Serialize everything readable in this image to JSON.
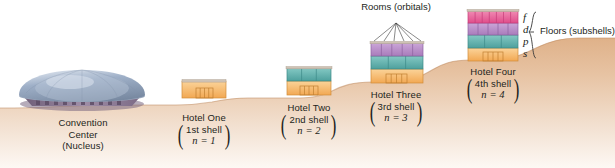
{
  "figure": {
    "background": "#ffffff"
  },
  "ground": {
    "name": "terraced-hillside",
    "colors": {
      "top": "#e8c8ab",
      "mid": "#d8ab86",
      "bottom": "#f6ece3",
      "edge": "#c08d63"
    }
  },
  "nucleus": {
    "label_lines": [
      "Convention",
      "Center",
      "(Nucleus)"
    ],
    "dome_color": "#8d9cb8",
    "dome_highlight": "#cdd6e4",
    "base_color": "#8a7590"
  },
  "hotels": [
    {
      "id": "hotel-one",
      "name_line": "Hotel One",
      "shell_line": "1st shell",
      "n_line": "n = 1",
      "floors": [
        {
          "subshell": "s",
          "rooms": 1,
          "color": "#f6b96a"
        }
      ]
    },
    {
      "id": "hotel-two",
      "name_line": "Hotel Two",
      "shell_line": "2nd shell",
      "n_line": "n = 2",
      "floors": [
        {
          "subshell": "p",
          "rooms": 3,
          "color": "#5fb3b0"
        },
        {
          "subshell": "s",
          "rooms": 1,
          "color": "#f6b96a"
        }
      ]
    },
    {
      "id": "hotel-three",
      "name_line": "Hotel Three",
      "shell_line": "3rd shell",
      "n_line": "n = 3",
      "floors": [
        {
          "subshell": "d",
          "rooms": 5,
          "color": "#b98fc9"
        },
        {
          "subshell": "p",
          "rooms": 3,
          "color": "#5fb3b0"
        },
        {
          "subshell": "s",
          "rooms": 1,
          "color": "#f6b96a"
        }
      ]
    },
    {
      "id": "hotel-four",
      "name_line": "Hotel Four",
      "shell_line": "4th shell",
      "n_line": "n = 4",
      "floors": [
        {
          "subshell": "f",
          "rooms": 7,
          "color": "#e8629a"
        },
        {
          "subshell": "d",
          "rooms": 5,
          "color": "#b98fc9"
        },
        {
          "subshell": "p",
          "rooms": 3,
          "color": "#5fb3b0"
        },
        {
          "subshell": "s",
          "rooms": 1,
          "color": "#f6b96a"
        }
      ]
    }
  ],
  "callouts": {
    "rooms": {
      "line1": "Rooms",
      "line2": "(orbitals)"
    },
    "floors": {
      "line1": "Floors",
      "line2": "(subshells)"
    }
  },
  "subshell_letters": [
    "f",
    "d",
    "p",
    "s"
  ]
}
